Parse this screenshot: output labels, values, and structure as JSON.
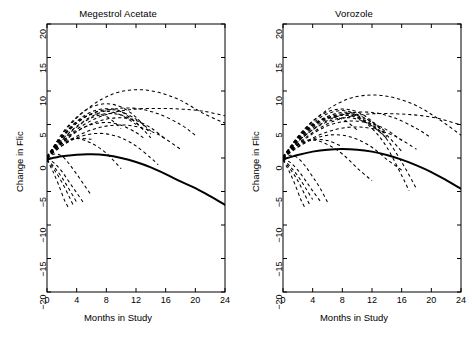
{
  "figure": {
    "width": 472,
    "height": 339,
    "background": "#ffffff",
    "line_color": "#000000"
  },
  "chart_data": [
    {
      "type": "line",
      "panel": "left",
      "title": "Megestrol Acetate",
      "xlabel": "Months in Study",
      "ylabel": "Change in Flic",
      "xlim": [
        0,
        24
      ],
      "ylim": [
        -20,
        20
      ],
      "xticks": [
        0,
        4,
        8,
        12,
        16,
        20,
        24
      ],
      "yticks": [
        -20,
        -15,
        -10,
        -5,
        0,
        5,
        10,
        15,
        20
      ],
      "grid": false,
      "legend": "none",
      "series": [
        {
          "name": "population-average",
          "style": "solid",
          "linewidth": 2.0,
          "x": [
            0,
            2,
            4,
            6,
            8,
            10,
            12,
            14,
            16,
            18,
            20,
            22,
            24
          ],
          "values": [
            -0.2,
            0.25,
            0.5,
            0.55,
            0.4,
            0.0,
            -0.6,
            -1.4,
            -2.4,
            -3.5,
            -4.5,
            -5.7,
            -7.0
          ]
        },
        {
          "name": "subject-1",
          "style": "dashed",
          "x": [
            0,
            3,
            6,
            9,
            12,
            15,
            18,
            21,
            24
          ],
          "values": [
            0.2,
            4.8,
            7.8,
            9.6,
            10.2,
            9.8,
            8.6,
            6.7,
            5.2
          ]
        },
        {
          "name": "subject-2",
          "style": "dashed",
          "x": [
            0,
            3,
            6,
            9,
            12,
            15,
            18,
            21,
            24
          ],
          "values": [
            0.1,
            3.4,
            5.6,
            6.8,
            7.3,
            7.4,
            7.3,
            7.0,
            6.3
          ]
        },
        {
          "name": "subject-3",
          "style": "dashed",
          "x": [
            0,
            3,
            6,
            9,
            12,
            15,
            18,
            20
          ],
          "values": [
            0.3,
            3.8,
            6.2,
            7.3,
            7.4,
            6.6,
            5.0,
            3.4
          ]
        },
        {
          "name": "subject-4",
          "style": "dashed",
          "x": [
            0,
            2,
            4,
            6,
            8,
            10,
            12,
            14
          ],
          "values": [
            0.1,
            3.6,
            6.1,
            7.6,
            8.1,
            7.6,
            6.1,
            3.6
          ]
        },
        {
          "name": "subject-5",
          "style": "dashed",
          "x": [
            0,
            2,
            4,
            6,
            8,
            10,
            12
          ],
          "values": [
            0.2,
            3.0,
            5.2,
            6.6,
            7.0,
            6.4,
            5.0
          ]
        },
        {
          "name": "subject-6",
          "style": "dashed",
          "x": [
            0,
            2,
            4,
            6,
            8,
            10,
            12,
            14
          ],
          "values": [
            0.0,
            2.6,
            4.6,
            6.0,
            6.6,
            6.4,
            5.3,
            3.0
          ]
        },
        {
          "name": "subject-7",
          "style": "dashed",
          "x": [
            0,
            2,
            4,
            6,
            8,
            10
          ],
          "values": [
            0.2,
            3.2,
            5.4,
            6.5,
            6.2,
            4.4
          ]
        },
        {
          "name": "subject-8",
          "style": "dashed",
          "x": [
            0,
            2,
            4,
            6,
            8,
            10,
            12,
            14,
            16
          ],
          "values": [
            0.0,
            2.2,
            3.9,
            5.1,
            5.8,
            6.0,
            5.6,
            4.5,
            2.8
          ]
        },
        {
          "name": "subject-9",
          "style": "dashed",
          "x": [
            0,
            3,
            6,
            9,
            12,
            15,
            18
          ],
          "values": [
            0.1,
            2.6,
            4.2,
            4.9,
            4.7,
            3.5,
            1.3
          ]
        },
        {
          "name": "subject-10",
          "style": "dashed",
          "x": [
            0,
            2,
            4,
            6,
            8,
            10,
            12,
            13
          ],
          "values": [
            0.2,
            2.4,
            4.0,
            5.0,
            5.3,
            4.9,
            3.8,
            3.0
          ]
        },
        {
          "name": "subject-11",
          "style": "dashed",
          "x": [
            0,
            2,
            4,
            6,
            8,
            10,
            12,
            14,
            15
          ],
          "values": [
            0.0,
            1.8,
            3.0,
            3.6,
            3.6,
            3.0,
            1.8,
            0.0,
            -1.0
          ]
        },
        {
          "name": "subject-12",
          "style": "dashed",
          "x": [
            0,
            2,
            4,
            6
          ],
          "values": [
            0.1,
            2.1,
            2.9,
            2.8
          ]
        },
        {
          "name": "subject-13",
          "style": "dashed",
          "x": [
            0,
            2,
            4,
            6,
            8,
            10
          ],
          "values": [
            0.1,
            2.3,
            2.9,
            2.2,
            0.7,
            -1.6
          ]
        },
        {
          "name": "subject-14",
          "style": "dashed",
          "x": [
            0,
            1,
            2,
            3,
            4,
            5,
            6
          ],
          "values": [
            0.0,
            0.6,
            0.3,
            -0.9,
            -2.4,
            -4.0,
            -5.6
          ]
        },
        {
          "name": "subject-15",
          "style": "dashed",
          "x": [
            0,
            1,
            2,
            3,
            4
          ],
          "values": [
            -0.2,
            -1.4,
            -2.9,
            -4.7,
            -6.6
          ]
        },
        {
          "name": "subject-16",
          "style": "dashed",
          "x": [
            0,
            1,
            2,
            3,
            3.6
          ],
          "values": [
            -0.3,
            -1.8,
            -3.6,
            -5.8,
            -7.2
          ]
        },
        {
          "name": "subject-17",
          "style": "dashed",
          "x": [
            0,
            0.8,
            1.6,
            2.4,
            3
          ],
          "values": [
            -0.3,
            -2.0,
            -4.1,
            -6.4,
            -7.6
          ]
        },
        {
          "name": "subject-18",
          "style": "dashed",
          "x": [
            0,
            1,
            2,
            3,
            4,
            5
          ],
          "values": [
            0.0,
            -0.8,
            -2.0,
            -3.6,
            -5.2,
            -6.8
          ]
        },
        {
          "name": "subject-19",
          "style": "dashed",
          "x": [
            0,
            3,
            6,
            9,
            12,
            14
          ],
          "values": [
            0.2,
            4.2,
            6.6,
            7.2,
            5.8,
            4.0
          ]
        },
        {
          "name": "subject-20",
          "style": "dashed",
          "x": [
            0,
            3,
            6,
            9,
            11,
            13
          ],
          "values": [
            0.1,
            4.4,
            6.9,
            7.3,
            6.2,
            4.2
          ]
        }
      ]
    },
    {
      "type": "line",
      "panel": "right",
      "title": "Vorozole",
      "xlabel": "Months in Study",
      "ylabel": "Change in Flic",
      "xlim": [
        0,
        24
      ],
      "ylim": [
        -20,
        20
      ],
      "xticks": [
        0,
        4,
        8,
        12,
        16,
        20,
        24
      ],
      "yticks": [
        -20,
        -15,
        -10,
        -5,
        0,
        5,
        10,
        15,
        20
      ],
      "grid": false,
      "legend": "none",
      "series": [
        {
          "name": "population-average",
          "style": "solid",
          "linewidth": 2.0,
          "x": [
            0,
            2,
            4,
            6,
            8,
            10,
            12,
            14,
            16,
            18,
            20,
            22,
            24
          ],
          "values": [
            -0.2,
            0.45,
            0.95,
            1.25,
            1.35,
            1.25,
            0.95,
            0.45,
            -0.25,
            -1.1,
            -2.1,
            -3.3,
            -4.6
          ]
        },
        {
          "name": "subject-1",
          "style": "dashed",
          "x": [
            0,
            3,
            6,
            9,
            12,
            15,
            18,
            21,
            24
          ],
          "values": [
            0.2,
            4.4,
            7.2,
            8.9,
            9.4,
            9.0,
            7.8,
            5.8,
            3.4
          ]
        },
        {
          "name": "subject-2",
          "style": "dashed",
          "x": [
            0,
            3,
            6,
            9,
            12,
            15,
            18,
            21,
            24
          ],
          "values": [
            0.1,
            3.0,
            5.1,
            6.2,
            6.6,
            6.6,
            6.4,
            5.9,
            4.9
          ]
        },
        {
          "name": "subject-3",
          "style": "dashed",
          "x": [
            0,
            3,
            6,
            9,
            12,
            15,
            18,
            20
          ],
          "values": [
            0.3,
            3.4,
            5.6,
            6.7,
            6.8,
            6.0,
            4.4,
            3.0
          ]
        },
        {
          "name": "subject-4",
          "style": "dashed",
          "x": [
            0,
            2,
            4,
            6,
            8,
            10,
            12,
            14
          ],
          "values": [
            0.1,
            3.2,
            5.5,
            6.9,
            7.3,
            6.9,
            5.5,
            3.2
          ]
        },
        {
          "name": "subject-5",
          "style": "dashed",
          "x": [
            0,
            2,
            4,
            6,
            8,
            10,
            12,
            13
          ],
          "values": [
            0.2,
            2.8,
            4.8,
            6.0,
            6.4,
            6.0,
            4.8,
            3.9
          ]
        },
        {
          "name": "subject-6",
          "style": "dashed",
          "x": [
            0,
            2,
            4,
            6,
            8,
            10,
            12,
            14
          ],
          "values": [
            0.0,
            2.4,
            4.2,
            5.4,
            6.0,
            5.8,
            4.8,
            2.9
          ]
        },
        {
          "name": "subject-7",
          "style": "dashed",
          "x": [
            0,
            2,
            4,
            6,
            8,
            10
          ],
          "values": [
            0.2,
            3.0,
            5.0,
            6.0,
            5.8,
            4.2
          ]
        },
        {
          "name": "subject-8",
          "style": "dashed",
          "x": [
            0,
            2,
            4,
            6,
            8,
            10,
            12,
            14,
            16
          ],
          "values": [
            0.0,
            2.0,
            3.6,
            4.8,
            5.4,
            5.5,
            5.1,
            4.2,
            2.6
          ]
        },
        {
          "name": "subject-9",
          "style": "dashed",
          "x": [
            0,
            3,
            6,
            9,
            12,
            15,
            18
          ],
          "values": [
            0.1,
            2.4,
            3.9,
            4.6,
            4.4,
            3.3,
            1.3
          ]
        },
        {
          "name": "subject-10",
          "style": "dashed",
          "x": [
            0,
            3,
            6,
            9,
            12,
            14
          ],
          "values": [
            0.2,
            4.0,
            6.2,
            6.8,
            5.4,
            3.8
          ]
        },
        {
          "name": "subject-11",
          "style": "dashed",
          "x": [
            0,
            2,
            4,
            6,
            8,
            10,
            12,
            14,
            16
          ],
          "values": [
            0.0,
            1.6,
            2.8,
            3.4,
            3.4,
            2.8,
            1.6,
            -0.2,
            -1.8
          ]
        },
        {
          "name": "subject-12",
          "style": "dashed",
          "x": [
            0,
            2,
            4,
            6,
            8
          ],
          "values": [
            0.1,
            1.9,
            2.7,
            2.6,
            1.7
          ]
        },
        {
          "name": "subject-13",
          "style": "dashed",
          "x": [
            0,
            2,
            4,
            6,
            8,
            10,
            12
          ],
          "values": [
            0.1,
            2.1,
            2.7,
            2.0,
            0.6,
            -1.5,
            -3.4
          ]
        },
        {
          "name": "subject-14",
          "style": "dashed",
          "x": [
            0,
            1,
            2,
            3,
            4,
            5,
            6
          ],
          "values": [
            0.0,
            0.4,
            0.0,
            -1.2,
            -2.8,
            -4.5,
            -6.6
          ]
        },
        {
          "name": "subject-15",
          "style": "dashed",
          "x": [
            0,
            1,
            2,
            3,
            4
          ],
          "values": [
            -0.2,
            -1.3,
            -2.7,
            -4.4,
            -6.2
          ]
        },
        {
          "name": "subject-16",
          "style": "dashed",
          "x": [
            0,
            1,
            2,
            3,
            3.6
          ],
          "values": [
            -0.3,
            -1.7,
            -3.4,
            -5.6,
            -7.0
          ]
        },
        {
          "name": "subject-17",
          "style": "dashed",
          "x": [
            0,
            0.8,
            1.6,
            2.4,
            3
          ],
          "values": [
            -0.3,
            -1.9,
            -3.9,
            -6.2,
            -7.5
          ]
        },
        {
          "name": "subject-18",
          "style": "dashed",
          "x": [
            0,
            1,
            2,
            3,
            4,
            5
          ],
          "values": [
            0.0,
            -0.7,
            -1.8,
            -3.3,
            -4.9,
            -6.4
          ]
        },
        {
          "name": "subject-19",
          "style": "dashed",
          "x": [
            0,
            3,
            6,
            9,
            12,
            14,
            16
          ],
          "values": [
            0.2,
            3.8,
            6.0,
            6.6,
            5.3,
            3.4,
            1.0
          ]
        },
        {
          "name": "subject-20",
          "style": "dashed",
          "x": [
            0,
            3,
            6,
            9,
            12,
            14,
            16,
            17
          ],
          "values": [
            0.1,
            4.2,
            6.6,
            6.9,
            4.4,
            1.6,
            -2.6,
            -4.9
          ]
        },
        {
          "name": "subject-21",
          "style": "dashed",
          "x": [
            0,
            3,
            6,
            9,
            12,
            14,
            16,
            18
          ],
          "values": [
            0.1,
            3.6,
            5.8,
            6.4,
            5.0,
            2.8,
            -0.6,
            -4.6
          ]
        }
      ]
    }
  ]
}
